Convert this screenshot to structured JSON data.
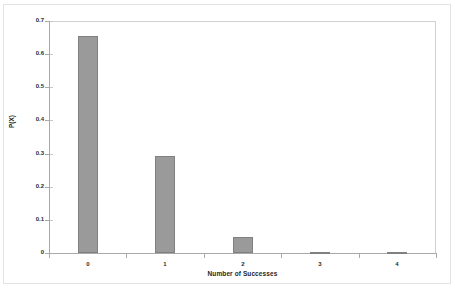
{
  "chart_data": {
    "type": "bar",
    "title": "",
    "xlabel": "Number of Successes",
    "ylabel": "P(X)",
    "categories": [
      "0",
      "1",
      "2",
      "3",
      "4"
    ],
    "values": [
      0.656,
      0.292,
      0.049,
      0.003,
      0.0001
    ],
    "series": [
      {
        "name": "P(X)",
        "values": [
          0.656,
          0.292,
          0.049,
          0.003,
          0.0001
        ]
      }
    ],
    "ylim": [
      0,
      0.7
    ],
    "ytick_labels": [
      "0",
      "0.1",
      "0.2",
      "0.3",
      "0.4",
      "0.5",
      "0.6",
      "0.7"
    ],
    "ytick_values": [
      0,
      0.1,
      0.2,
      0.3,
      0.4,
      0.5,
      0.6,
      0.7
    ],
    "xtick_labels": [
      "0",
      "1",
      "2",
      "3",
      "4"
    ],
    "grid": false,
    "legend": "none",
    "bar_color": "#9a9a9a",
    "bar_border_color": "#808080",
    "axis_color": "#a9a9a9",
    "background_color": "#ffffff",
    "frame_color": "#e3e3e3"
  }
}
